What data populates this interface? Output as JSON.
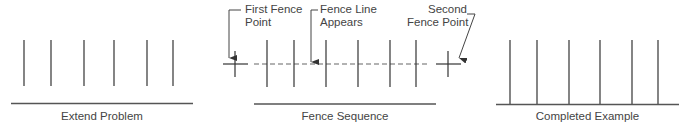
{
  "panels": [
    {
      "caption": "Extend Problem"
    },
    {
      "caption": "Fence Sequence"
    },
    {
      "caption": "Completed Example"
    }
  ],
  "annotations": {
    "first_fence_point": {
      "line1": "First Fence",
      "line2": "Point"
    },
    "fence_line_appears": {
      "line1": "Fence Line",
      "line2": "Appears"
    },
    "second_fence_point": {
      "line1": "Second",
      "line2": "Fence Point"
    }
  },
  "colors": {
    "line": "#333333",
    "dashed": "#666666",
    "text": "#444444"
  }
}
